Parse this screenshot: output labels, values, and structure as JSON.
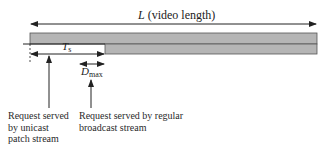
{
  "diagram": {
    "length_label": {
      "symbol": "L",
      "text": "(video length)"
    },
    "ts_label": {
      "symbol": "T",
      "sub": "s"
    },
    "dmax_label": {
      "symbol": "D",
      "sub": "max"
    },
    "annotations": [
      {
        "lines": [
          "Request served",
          "by unicast",
          "patch stream"
        ]
      },
      {
        "lines": [
          "Request served by regular",
          "broadcast stream"
        ]
      }
    ],
    "colors": {
      "bar_fill": "#b5b5b5",
      "line": "#222222"
    }
  }
}
